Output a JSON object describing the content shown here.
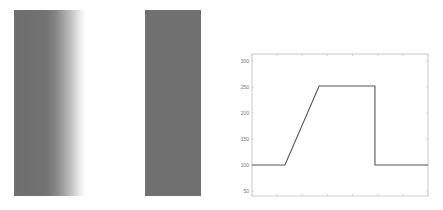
{
  "panels": {
    "left_image": {
      "description": "gray bar with soft right edge (blurred step)",
      "color": "#6e6e6e"
    },
    "middle_image": {
      "description": "gray bar with sharp edges",
      "color": "#707070"
    }
  },
  "chart_data": {
    "type": "line",
    "title": "",
    "xlabel": "",
    "ylabel": "",
    "xlim": [
      0,
      7
    ],
    "ylim": [
      40,
      310
    ],
    "yticks": [
      50,
      100,
      150,
      200,
      250,
      300
    ],
    "ytick_labels": [
      "50",
      "100",
      "150",
      "200",
      "250",
      "300"
    ],
    "xticks": [
      0,
      1,
      2,
      3,
      4,
      5,
      6,
      7
    ],
    "xtick_labels": [],
    "grid": false,
    "legend": null,
    "series": [
      {
        "name": "profile",
        "color": "#555555",
        "x": [
          0,
          1.31,
          2.67,
          4.89,
          4.89,
          7
        ],
        "y": [
          100,
          100,
          252,
          252,
          100,
          100
        ]
      }
    ]
  }
}
